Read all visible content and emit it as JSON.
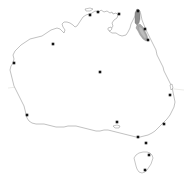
{
  "figure": {
    "background_color": "#ffffff",
    "coastline_color": "#8d8d8d",
    "shading_colors": {
      "dark": "#8d8d8d",
      "mid": "#a9a9a9",
      "light": "#bdbdbd"
    },
    "dot_color": "#141414",
    "graticule_color": "#d8d8d2",
    "width_px": 193,
    "height_px": 180
  },
  "graticule": {
    "lines": [
      {
        "name": "tropic-of-capricorn",
        "orientation": "horizontal",
        "path": "M 8,88 C 50,83 120,83 184,90"
      }
    ]
  },
  "mainland": {
    "name": "australia-mainland",
    "path": "M 92,13 L 95,11 L 99,12 L 101,10 L 104,12 L 107,11 L 110,13 L 112,12 L 113,14 L 116,13 L 118,15 L 117,18 L 114,20 L 112,23 L 113,26 L 111,29 L 109,31 L 112,33 L 116,33 L 119,35 L 122,36 L 126,35 L 128,32 L 130,28 L 131,24 L 133,20 L 135,16 L 136,12 L 138,9 L 140,11 L 141,15 L 142,20 L 144,25 L 146,30 L 148,34 L 150,38 L 152,42 L 154,46 L 156,50 L 157,55 L 159,59 L 161,63 L 163,67 L 164,71 L 166,75 L 168,79 L 170,83 L 172,87 L 173,92 L 174,97 L 175,102 L 174,107 L 172,111 L 170,115 L 167,119 L 164,122 L 161,125 L 158,128 L 155,131 L 152,133 L 148,135 L 144,136 L 140,137 L 136,137 L 132,136 L 128,135 L 124,134 L 120,133 L 116,132 L 112,131 L 108,130 L 104,130 L 100,131 L 96,131 L 92,130 L 88,129 L 84,128 L 80,127 L 76,126 L 72,126 L 68,126 L 64,127 L 60,127 L 56,127 L 52,126 L 48,125 L 44,124 L 40,124 L 36,124 L 32,123 L 29,121 L 27,118 L 26,114 L 25,110 L 24,106 L 22,102 L 20,98 L 18,94 L 16,90 L 14,86 L 13,82 L 12,78 L 11,74 L 10,70 L 11,66 L 13,63 L 14,59 L 13,55 L 15,51 L 18,48 L 21,45 L 24,43 L 27,41 L 30,39 L 34,38 L 38,37 L 42,36 L 45,34 L 48,32 L 51,30 L 54,29 L 57,28 L 60,29 L 62,31 L 64,33 L 65,30 L 63,27 L 62,24 L 64,22 L 67,22 L 70,23 L 73,25 L 75,27 L 77,26 L 79,23 L 81,20 L 83,17 L 86,15 L 89,14 Z"
  },
  "islands": [
    {
      "name": "tasmania",
      "path": "M 136,155 L 139,153 L 143,152 L 147,152 L 150,153 L 152,155 L 153,158 L 152,161 L 151,164 L 149,167 L 147,170 L 145,172 L 142,173 L 139,172 L 137,169 L 136,166 L 135,162 L 134,158 Z"
    },
    {
      "name": "kangaroo-island",
      "path": "M 113,126 L 117,125 L 120,126 L 119,128 L 115,128 Z"
    },
    {
      "name": "melville-island",
      "path": "M 85,9 L 90,8 L 93,9 L 90,11 L 86,11 Z"
    },
    {
      "name": "groote-eylandt",
      "path": "M 108,28 L 111,27 L 112,29 L 110,31 L 108,30 Z"
    },
    {
      "name": "fraser-island",
      "path": "M 170,85 L 172,84 L 173,88 L 171,90 Z"
    }
  ],
  "distribution_range": {
    "label": "shaded-distribution-range",
    "region": "north-eastern Queensland coastal ranges",
    "polygons": [
      {
        "name": "range-polygon-north",
        "shade": "dark",
        "path": "M 137,9 L 139,10 L 140,14 L 140,19 L 139,23 L 137,25 L 135,23 L 135,18 L 135,13 Z"
      },
      {
        "name": "range-polygon-central",
        "shade": "mid",
        "path": "M 137,25 L 140,24 L 143,27 L 145,31 L 147,35 L 148,39 L 146,41 L 143,39 L 140,35 L 138,31 L 136,28 Z"
      },
      {
        "name": "range-polygon-inner",
        "shade": "light",
        "path": "M 139,26 L 142,28 L 144,32 L 146,36 L 146,39 L 144,38 L 141,34 L 139,30 Z"
      }
    ]
  },
  "localities": [
    {
      "name": "locality-darwin",
      "x": 90,
      "y": 15,
      "label": ""
    },
    {
      "name": "locality-arnhem",
      "x": 98,
      "y": 12,
      "label": ""
    },
    {
      "name": "locality-gulf",
      "x": 119,
      "y": 14,
      "label": ""
    },
    {
      "name": "locality-cape-york",
      "x": 138,
      "y": 11,
      "label": ""
    },
    {
      "name": "locality-cairns",
      "x": 145,
      "y": 29,
      "label": ""
    },
    {
      "name": "locality-townsville",
      "x": 148,
      "y": 40,
      "label": ""
    },
    {
      "name": "locality-port-hedland",
      "x": 53,
      "y": 44,
      "label": ""
    },
    {
      "name": "locality-northwest-cape",
      "x": 14,
      "y": 63,
      "label": ""
    },
    {
      "name": "locality-alice-springs",
      "x": 100,
      "y": 72,
      "label": ""
    },
    {
      "name": "locality-brisbane",
      "x": 170,
      "y": 95,
      "label": ""
    },
    {
      "name": "locality-perth",
      "x": 27,
      "y": 115,
      "label": ""
    },
    {
      "name": "locality-adelaide",
      "x": 117,
      "y": 122,
      "label": ""
    },
    {
      "name": "locality-sydney",
      "x": 164,
      "y": 124,
      "label": ""
    },
    {
      "name": "locality-melbourne",
      "x": 138,
      "y": 137,
      "label": ""
    },
    {
      "name": "locality-canberra",
      "x": 146,
      "y": 143,
      "label": ""
    },
    {
      "name": "locality-launceston",
      "x": 149,
      "y": 155,
      "label": ""
    },
    {
      "name": "locality-hobart",
      "x": 145,
      "y": 170,
      "label": ""
    }
  ]
}
